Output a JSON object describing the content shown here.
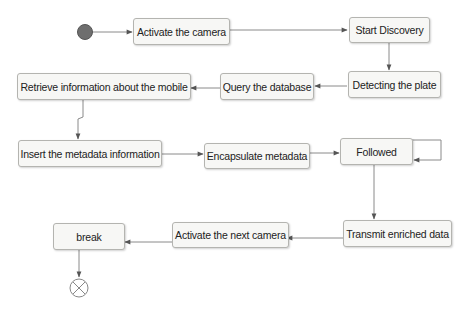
{
  "diagram": {
    "type": "activity-diagram",
    "nodes": [
      {
        "id": "activate-camera",
        "label": "Activate the camera"
      },
      {
        "id": "start-discovery",
        "label": "Start Discovery"
      },
      {
        "id": "detecting-plate",
        "label": "Detecting the plate"
      },
      {
        "id": "query-database",
        "label": "Query the database"
      },
      {
        "id": "retrieve-info",
        "label": "Retrieve information about the mobile"
      },
      {
        "id": "insert-metadata",
        "label": "Insert the metadata information"
      },
      {
        "id": "encapsulate-metadata",
        "label": "Encapsulate metadata"
      },
      {
        "id": "followed",
        "label": "Followed"
      },
      {
        "id": "transmit-data",
        "label": "Transmit enriched data"
      },
      {
        "id": "activate-next-camera",
        "label": "Activate the next camera"
      },
      {
        "id": "break",
        "label": "break"
      }
    ],
    "edges": [
      {
        "from": "initial",
        "to": "activate-camera"
      },
      {
        "from": "activate-camera",
        "to": "start-discovery"
      },
      {
        "from": "start-discovery",
        "to": "detecting-plate"
      },
      {
        "from": "detecting-plate",
        "to": "query-database"
      },
      {
        "from": "query-database",
        "to": "retrieve-info"
      },
      {
        "from": "retrieve-info",
        "to": "insert-metadata"
      },
      {
        "from": "insert-metadata",
        "to": "encapsulate-metadata"
      },
      {
        "from": "encapsulate-metadata",
        "to": "followed"
      },
      {
        "from": "followed",
        "to": "followed"
      },
      {
        "from": "followed",
        "to": "transmit-data"
      },
      {
        "from": "transmit-data",
        "to": "activate-next-camera"
      },
      {
        "from": "activate-next-camera",
        "to": "break"
      },
      {
        "from": "break",
        "to": "final"
      }
    ],
    "colors": {
      "node_fill": "#f7f7f5",
      "node_border": "#b4b4b0",
      "edge": "#8a8a8a",
      "arrowhead": "#555555",
      "initial_node": "#6e6e6e"
    }
  }
}
